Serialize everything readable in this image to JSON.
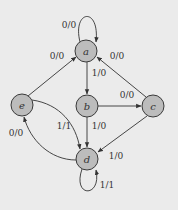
{
  "diagram": {
    "title": "",
    "colors": {
      "background": "#ebebeb",
      "node_fill": "#bcbcbc",
      "stroke": "#333333"
    },
    "nodes": [
      {
        "id": "a",
        "label": "a",
        "x": 86,
        "y": 51
      },
      {
        "id": "b",
        "label": "b",
        "x": 87,
        "y": 106
      },
      {
        "id": "c",
        "label": "c",
        "x": 153,
        "y": 106
      },
      {
        "id": "d",
        "label": "d",
        "x": 87,
        "y": 159
      },
      {
        "id": "e",
        "label": "e",
        "x": 22,
        "y": 105
      }
    ],
    "edges": [
      {
        "from": "a",
        "to": "a",
        "label": "0/0"
      },
      {
        "from": "a",
        "to": "b",
        "label": "1/0"
      },
      {
        "from": "e",
        "to": "a",
        "label": "0/0"
      },
      {
        "from": "c",
        "to": "a",
        "label": "0/0"
      },
      {
        "from": "b",
        "to": "c",
        "label": "0/0"
      },
      {
        "from": "b",
        "to": "d",
        "label": "1/0"
      },
      {
        "from": "c",
        "to": "d",
        "label": "1/0"
      },
      {
        "from": "e",
        "to": "d",
        "label": "1/1"
      },
      {
        "from": "d",
        "to": "e",
        "label": "0/0"
      },
      {
        "from": "d",
        "to": "d",
        "label": "1/1"
      }
    ]
  }
}
